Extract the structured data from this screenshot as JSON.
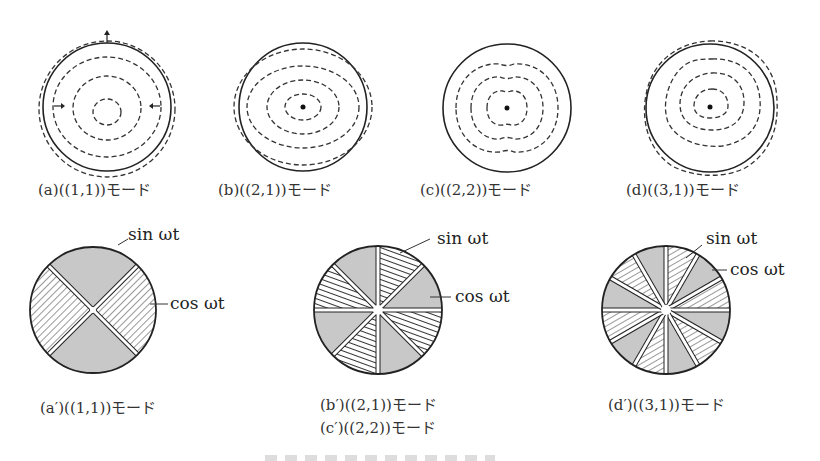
{
  "figure": {
    "top_row": [
      {
        "id": "a",
        "caption": "(a)((1,1))モード",
        "shape": "circle-with-arrows",
        "center_dot": false
      },
      {
        "id": "b",
        "caption": "(b)((2,1))モード",
        "shape": "ellipse",
        "center_dot": true
      },
      {
        "id": "c",
        "caption": "(c)((2,2))モード",
        "shape": "pinched",
        "center_dot": true
      },
      {
        "id": "d",
        "caption": "(d)((3,1))モード",
        "shape": "triangular",
        "center_dot": true
      }
    ],
    "bottom_row": [
      {
        "id": "a_prime",
        "caption_lines": [
          "(a′)((1,1))モード"
        ],
        "sectors": 4,
        "sin_label": "sin ωt",
        "cos_label": "cos ωt"
      },
      {
        "id": "bc_prime",
        "caption_lines": [
          "(b′)((2,1))モード",
          "(c′)((2,2))モード"
        ],
        "sectors": 8,
        "sin_label": "sin ωt",
        "cos_label": "cos ωt"
      },
      {
        "id": "d_prime",
        "caption_lines": [
          "(d′)((3,1))モード"
        ],
        "sectors": 12,
        "sin_label": "sin ωt",
        "cos_label": "cos ωt"
      }
    ],
    "colors": {
      "shaded": "#c8c8c8",
      "line": "#222222",
      "background": "#ffffff"
    }
  }
}
